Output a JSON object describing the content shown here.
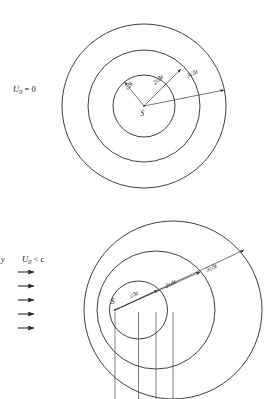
{
  "figure": {
    "panels": [
      {
        "id": "stationary-source",
        "condition_label": "U",
        "condition_sub": "0",
        "condition_rel": " = 0",
        "condition_full": "U0 = 0",
        "source_label": "S",
        "rays": [
          {
            "id": "ray-c-dt",
            "label": "cΔt"
          },
          {
            "id": "ray-2c-dt",
            "label": "2cΔt"
          },
          {
            "id": "ray-3c-dt",
            "label": "3cΔt"
          }
        ],
        "wavefront_count": 3
      },
      {
        "id": "subsonic-source",
        "axis_label": "y",
        "condition_label": "U",
        "condition_sub": "0",
        "condition_rel": " < c",
        "condition_full": "U0 < c",
        "source_label": "S",
        "rays": [
          {
            "id": "ray-c-dt",
            "label": "cΔt"
          },
          {
            "id": "ray-2c-dt",
            "label": "2cΔt"
          },
          {
            "id": "ray-3c-dt",
            "label": "3cΔt"
          }
        ],
        "flow_arrow_count": 5,
        "wavefront_count": 3,
        "drop_line_count": 4
      }
    ],
    "colors": {
      "stroke": "#2b2b2b",
      "ray_stroke": "#3a3a3a",
      "background": "#ffffff",
      "text": "#1a1a1a"
    }
  }
}
